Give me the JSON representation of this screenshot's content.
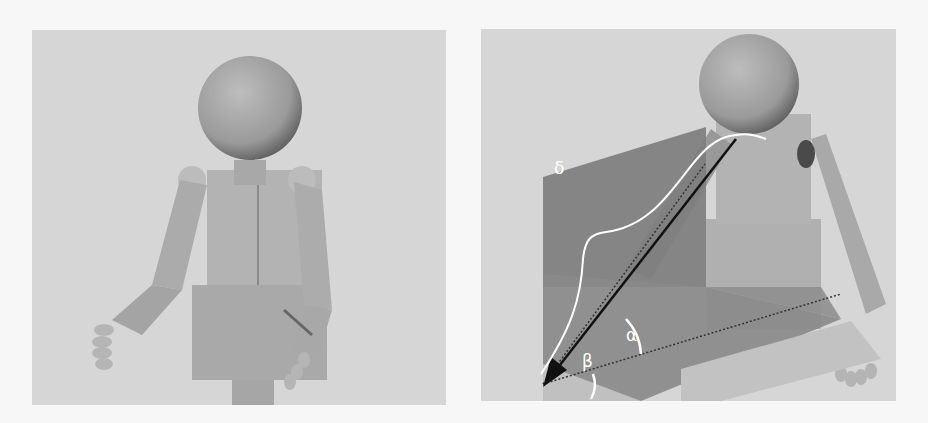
{
  "figure": {
    "panels": [
      {
        "id": "left",
        "description": "Humanoid robot render, arms extended forward"
      },
      {
        "id": "right",
        "description": "Humanoid robot render with reference planes and angle annotations"
      }
    ],
    "annotations": {
      "delta": "δ",
      "alpha": "α",
      "beta": "β"
    },
    "colors": {
      "background": "#d6d6d6",
      "robot": "#b0b0b0",
      "robot_shade": "#8e8e8e",
      "plane": "#7f7f7f",
      "annotation": "#ffffff",
      "vector": "#111111"
    }
  }
}
